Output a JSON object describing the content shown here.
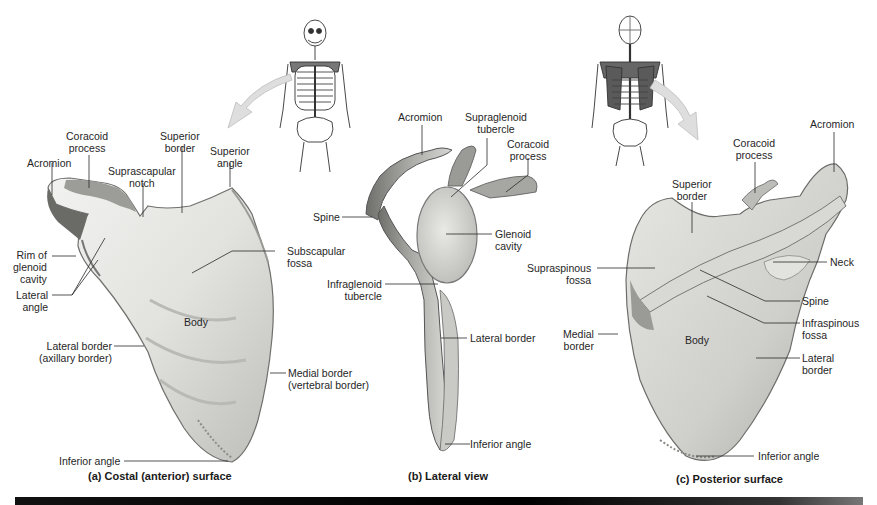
{
  "figure": {
    "subject": "Scapula",
    "panels": [
      {
        "caption": "(a) Costal (anterior) surface",
        "labels": {
          "acromion": "Acromion",
          "coracoid_process": "Coracoid\nprocess",
          "superior_border": "Superior\nborder",
          "superior_angle": "Superior\nangle",
          "suprascapular_notch": "Suprascapular\nnotch",
          "rim_glenoid": "Rim of\nglenoid\ncavity",
          "lateral_angle": "Lateral\nangle",
          "subscapular_fossa": "Subscapular\nfossa",
          "body": "Body",
          "lateral_border": "Lateral border\n(axillary border)",
          "medial_border": "Medial border\n(vertebral border)",
          "inferior_angle": "Inferior angle"
        }
      },
      {
        "caption": "(b) Lateral view",
        "labels": {
          "acromion": "Acromion",
          "supraglenoid_tubercle": "Supraglenoid\ntubercle",
          "coracoid_process": "Coracoid\nprocess",
          "spine": "Spine",
          "glenoid_cavity": "Glenoid\ncavity",
          "infraglenoid_tubercle": "Infraglenoid\ntubercle",
          "lateral_border": "Lateral border",
          "inferior_angle": "Inferior angle"
        }
      },
      {
        "caption": "(c) Posterior surface",
        "labels": {
          "acromion": "Acromion",
          "coracoid_process": "Coracoid\nprocess",
          "superior_border": "Superior\nborder",
          "neck": "Neck",
          "supraspinous_fossa": "Supraspinous\nfossa",
          "spine": "Spine",
          "infraspinous_fossa": "Infraspinous\nfossa",
          "medial_border": "Medial\nborder",
          "body": "Body",
          "lateral_border": "Lateral\nborder",
          "inferior_angle": "Inferior angle"
        }
      }
    ],
    "orientation_icons": [
      {
        "name": "skeleton-anterior-icon",
        "view": "anterior"
      },
      {
        "name": "skeleton-posterior-icon",
        "view": "posterior"
      }
    ],
    "colors": {
      "bone_light": "#ececea",
      "bone_mid": "#c9c9c6",
      "bone_dark": "#7d7d7a",
      "leader_line": "#2a2a2a",
      "arrow_fill": "#dcdcdc",
      "highlight_scapula": "#6b6b6b",
      "footer_bar": "#000000"
    }
  }
}
